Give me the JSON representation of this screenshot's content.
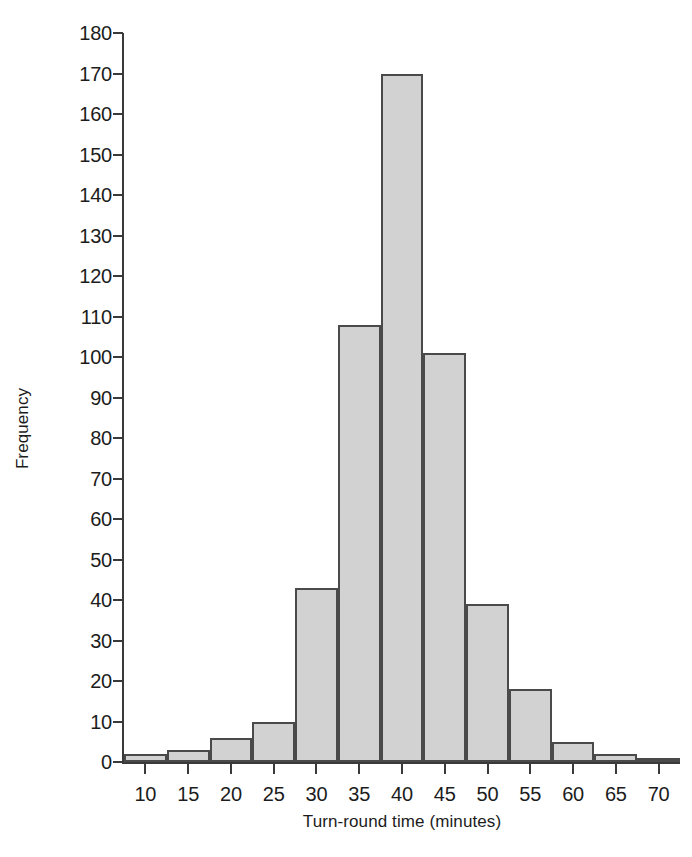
{
  "chart_data": {
    "type": "bar",
    "title": "",
    "xlabel": "Turn-round time (minutes)",
    "ylabel": "Frequency",
    "xlim": [
      7.5,
      72.5
    ],
    "ylim": [
      0,
      180
    ],
    "ytick_step": 10,
    "xtick_step": 5,
    "grid": false,
    "legend": null,
    "bin_width": 5,
    "bin_edges": [
      7.5,
      12.5,
      17.5,
      22.5,
      27.5,
      32.5,
      37.5,
      42.5,
      47.5,
      52.5,
      57.5,
      62.5,
      67.5,
      72.5
    ],
    "categories": [
      "7.5-12.5",
      "12.5-17.5",
      "17.5-22.5",
      "22.5-27.5",
      "27.5-32.5",
      "32.5-37.5",
      "37.5-42.5",
      "42.5-47.5",
      "47.5-52.5",
      "52.5-57.5",
      "57.5-62.5",
      "62.5-67.5",
      "67.5-72.5"
    ],
    "values": [
      2,
      3,
      6,
      10,
      43,
      108,
      170,
      101,
      39,
      18,
      5,
      2,
      1
    ],
    "ytick_labels": [
      "0",
      "10",
      "20",
      "30",
      "40",
      "50",
      "60",
      "70",
      "80",
      "90",
      "100",
      "110",
      "120",
      "130",
      "140",
      "150",
      "160",
      "170",
      "180"
    ],
    "ytick_values": [
      0,
      10,
      20,
      30,
      40,
      50,
      60,
      70,
      80,
      90,
      100,
      110,
      120,
      130,
      140,
      150,
      160,
      170,
      180
    ],
    "xtick_labels": [
      "10",
      "15",
      "20",
      "25",
      "30",
      "35",
      "40",
      "45",
      "50",
      "55",
      "60",
      "65",
      "70"
    ],
    "xtick_values": [
      10,
      15,
      20,
      25,
      30,
      35,
      40,
      45,
      50,
      55,
      60,
      65,
      70
    ],
    "colors": {
      "bar_fill": "#d2d2d2",
      "bar_border": "#4a4a4a",
      "axis": "#3a3a3a",
      "text": "#1c1c1c",
      "background": "#ffffff"
    }
  }
}
